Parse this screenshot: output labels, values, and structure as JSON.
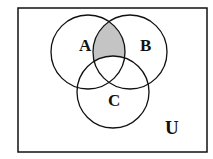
{
  "diagram": {
    "type": "venn",
    "universe_label": "U",
    "sets": [
      {
        "label": "A"
      },
      {
        "label": "B"
      },
      {
        "label": "C"
      }
    ],
    "shaded_region": "A ∩ B − C",
    "colors": {
      "stroke": "#111111",
      "shade": "#c4c4c4",
      "background": "#ffffff"
    }
  }
}
